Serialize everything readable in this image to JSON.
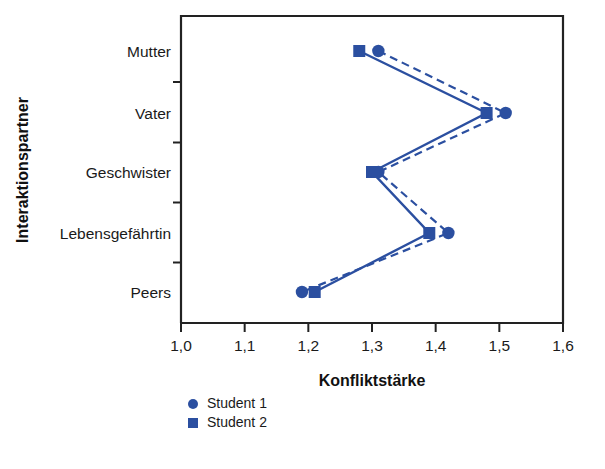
{
  "chart_data": {
    "type": "line",
    "title": "",
    "xlabel": "Konfliktstärke",
    "ylabel": "Interaktionspartner",
    "categories": [
      "Mutter",
      "Vater",
      "Geschwister",
      "Lebensgefährtin",
      "Peers"
    ],
    "orientation": "horizontal",
    "xlim": [
      1.0,
      1.6
    ],
    "xticks": [
      1.0,
      1.1,
      1.2,
      1.3,
      1.4,
      1.5,
      1.6
    ],
    "xtick_labels": [
      "1,0",
      "1,1",
      "1,2",
      "1,3",
      "1,4",
      "1,5",
      "1,6"
    ],
    "grid": false,
    "legend_position": "bottom-left",
    "series": [
      {
        "name": "Student 1",
        "marker": "circle",
        "linestyle": "dashed",
        "color": "#2B4FA0",
        "values": [
          1.31,
          1.51,
          1.31,
          1.42,
          1.19
        ]
      },
      {
        "name": "Student 2",
        "marker": "square",
        "linestyle": "solid",
        "color": "#2B4FA0",
        "values": [
          1.28,
          1.48,
          1.3,
          1.39,
          1.21
        ]
      }
    ]
  },
  "legend": {
    "items": [
      {
        "label": "Student 1",
        "marker": "circle"
      },
      {
        "label": "Student 2",
        "marker": "square"
      }
    ]
  },
  "colors": {
    "series": "#2B4FA0",
    "axis": "#222222",
    "text": "#1a1a1a",
    "background": "#ffffff"
  }
}
